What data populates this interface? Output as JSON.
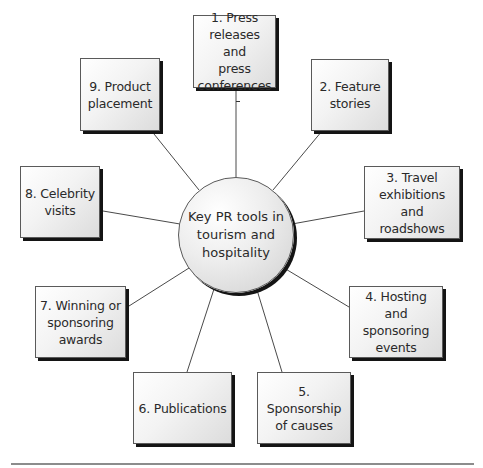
{
  "diagram": {
    "type": "hub-and-spoke",
    "center": {
      "label": "Key PR tools in\ntourism and\nhospitality"
    },
    "nodes": [
      {
        "id": 1,
        "label": "1. Press\nreleases and\npress\nconferences"
      },
      {
        "id": 2,
        "label": "2. Feature\nstories"
      },
      {
        "id": 3,
        "label": "3. Travel\nexhibitions and\nroadshows"
      },
      {
        "id": 4,
        "label": "4. Hosting and\nsponsoring\nevents"
      },
      {
        "id": 5,
        "label": "5. Sponsorship\nof causes"
      },
      {
        "id": 6,
        "label": "6. Publications"
      },
      {
        "id": 7,
        "label": "7. Winning or\nsponsoring\nawards"
      },
      {
        "id": 8,
        "label": "8. Celebrity\nvisits"
      },
      {
        "id": 9,
        "label": "9. Product\nplacement"
      }
    ],
    "colors": {
      "border": "#5a5a5a",
      "shadow": "#141414",
      "text": "#2a2a2a",
      "connector": "#4a4a4a",
      "rule": "#8c8c8c"
    }
  }
}
